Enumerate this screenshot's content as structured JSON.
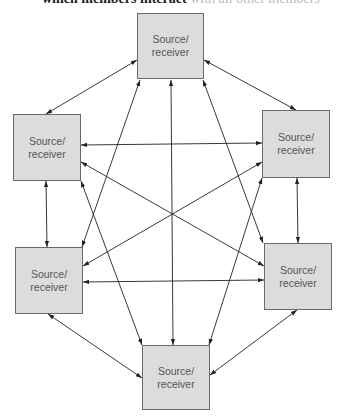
{
  "caption": {
    "bold": "which members interact",
    "rest": " with all other members"
  },
  "node_label_line1": "Source/",
  "node_label_line2": "receiver",
  "nodes": [
    {
      "id": "top",
      "x": 137,
      "y": 13
    },
    {
      "id": "upper-left",
      "x": 13,
      "y": 114
    },
    {
      "id": "upper-right",
      "x": 262,
      "y": 110
    },
    {
      "id": "lower-left",
      "x": 15,
      "y": 247
    },
    {
      "id": "lower-right",
      "x": 264,
      "y": 243
    },
    {
      "id": "bottom",
      "x": 142,
      "y": 345
    }
  ],
  "colors": {
    "box_fill": "#dcdcdc",
    "box_border": "#6a6a6a",
    "arrow": "#222222",
    "text": "#555555"
  }
}
